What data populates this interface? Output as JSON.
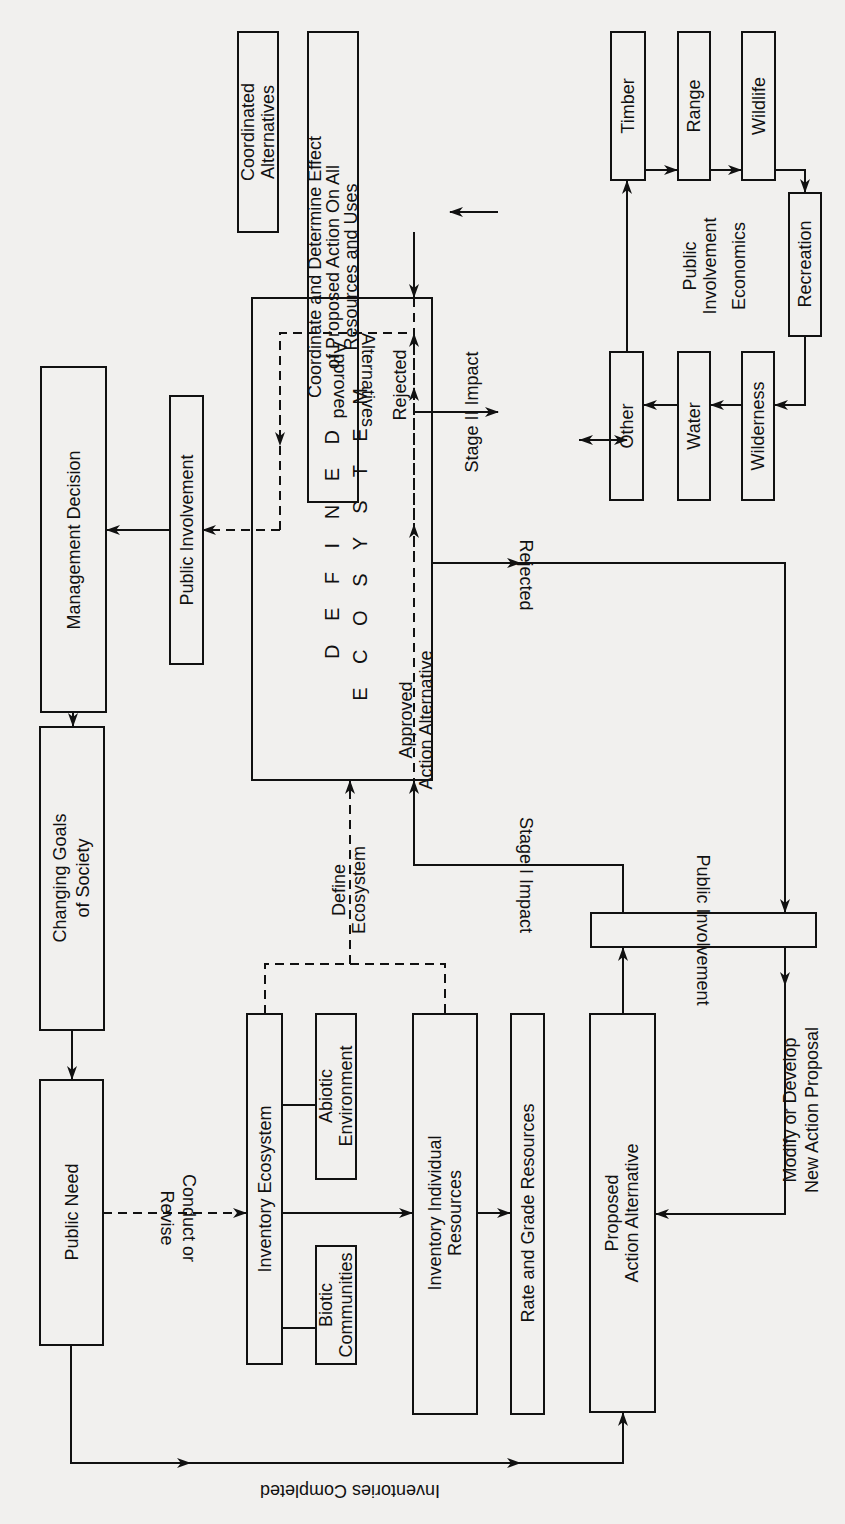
{
  "diagram": {
    "orientation": "rotated counter-clockwise",
    "nodes": {
      "management_decision": [
        "Management Decision"
      ],
      "changing_goals": [
        "Changing Goals",
        "of Society"
      ],
      "public_need": [
        "Public Need"
      ],
      "public_involvement_upper": [
        "Public Involvement"
      ],
      "defined_ecosystem": [
        "D E F I N E D",
        "E C O S Y S T E M"
      ],
      "coordinated_alternatives": [
        "Coordinated",
        "Alternatives"
      ],
      "coordinate_determine": [
        "Coordinate and Determine Effect",
        "of Proposed Action On All",
        "Resources and Uses"
      ],
      "timber": [
        "Timber"
      ],
      "range": [
        "Range"
      ],
      "wildlife": [
        "Wildlife"
      ],
      "recreation": [
        "Recreation"
      ],
      "wilderness": [
        "Wilderness"
      ],
      "water": [
        "Water"
      ],
      "other": [
        "Other"
      ],
      "center_note": [
        "Public",
        "Involvement"
      ],
      "economics": [
        "Economics"
      ],
      "inventory_ecosystem": [
        "Inventory Ecosystem"
      ],
      "abiotic": [
        "Abiotic",
        "Environment"
      ],
      "biotic": [
        "Biotic",
        "Communities"
      ],
      "inventory_individual": [
        "Inventory Individual",
        "Resources"
      ],
      "rate_grade": [
        "Rate and Grade Resources"
      ],
      "proposed_action": [
        "Proposed",
        "Action Alternative"
      ],
      "public_involvement_lower": [
        "Public Involvement"
      ],
      "modify_develop": [
        "Modify or Develop",
        "New Action Proposal"
      ]
    },
    "edge_labels": {
      "approved_alternatives": [
        "Approved",
        "Alternatives"
      ],
      "rejected_top": "Rejected",
      "approved_action": [
        "Approved",
        "Action Alternative"
      ],
      "stage2": "Stage II Impact",
      "rejected_right": "Rejected",
      "define_ecosystem": [
        "Define",
        "Ecosystem"
      ],
      "stage1": "Stage I Impact",
      "conduct_revise": [
        "Conduct or",
        "Revise"
      ],
      "inventories_completed": "Inventories Completed"
    }
  }
}
